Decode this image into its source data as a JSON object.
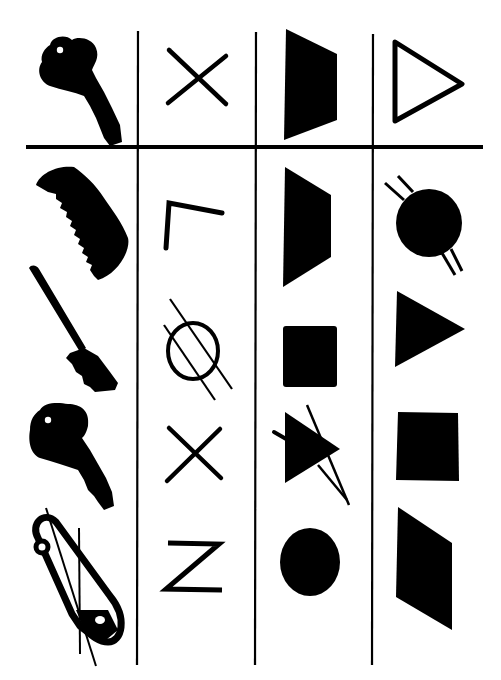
{
  "diagram": {
    "ink_color": "#000000",
    "background_color": "#ffffff",
    "columns": [
      {
        "name": "objects",
        "reference": "key",
        "options": [
          "comb",
          "toothbrush",
          "key",
          "safety-pin-crossed"
        ]
      },
      {
        "name": "letters",
        "reference": "x",
        "options": [
          "l-rotated",
          "circle-crossed",
          "x",
          "z"
        ]
      },
      {
        "name": "filled-shapes",
        "reference": "trapezoid",
        "options": [
          "trapezoid",
          "square",
          "triangle-crossed",
          "circle"
        ]
      },
      {
        "name": "outline-vs-filled",
        "reference": "triangle-outline",
        "options": [
          "circle-crossed",
          "triangle",
          "square",
          "parallelogram"
        ]
      }
    ]
  }
}
